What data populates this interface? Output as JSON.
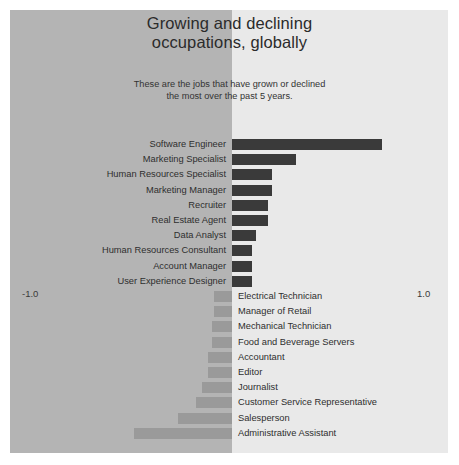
{
  "header": {
    "title_line1": "Growing and declining",
    "title_line2": "occupations, globally",
    "subtitle_line1": "These are the jobs that have grown or declined",
    "subtitle_line2": "the most over the past 5 years."
  },
  "axis": {
    "min_label": "-1.0",
    "max_label": "1.0"
  },
  "colors": {
    "positive_bar": "#3a3a3a",
    "negative_bar": "#9a9a9a",
    "panel_left": "#b4b4b4",
    "panel_right": "#e9e9e9"
  },
  "chart_data": {
    "type": "bar",
    "orientation": "horizontal",
    "title": "Growing and declining occupations, globally",
    "subtitle": "These are the jobs that have grown or declined the most over the past 5 years.",
    "xlabel": "",
    "ylabel": "",
    "xlim": [
      -1.0,
      1.0
    ],
    "grid": false,
    "legend": "none",
    "categories": [
      "Software Engineer",
      "Marketing Specialist",
      "Human Resources Specialist",
      "Marketing Manager",
      "Recruiter",
      "Real Estate Agent",
      "Data Analyst",
      "Human Resources Consultant",
      "Account Manager",
      "User Experience Designer",
      "Electrical Technician",
      "Manager of Retail",
      "Mechanical Technician",
      "Food and Beverage Servers",
      "Accountant",
      "Editor",
      "Journalist",
      "Customer Service Representative",
      "Salesperson",
      "Administrative Assistant"
    ],
    "values": [
      0.75,
      0.32,
      0.2,
      0.2,
      0.18,
      0.18,
      0.12,
      0.1,
      0.1,
      0.1,
      -0.09,
      -0.09,
      -0.1,
      -0.1,
      -0.12,
      -0.12,
      -0.15,
      -0.18,
      -0.27,
      -0.49
    ]
  }
}
